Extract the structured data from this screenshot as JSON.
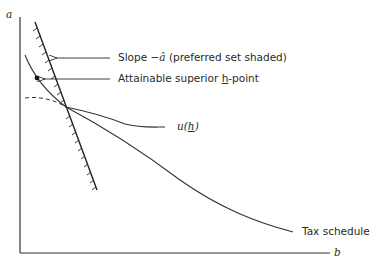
{
  "diagram": {
    "axes": {
      "y_label": "a",
      "x_label": "b"
    },
    "annotations": {
      "slope_prefix": "Slope −",
      "slope_symbol": "â",
      "slope_suffix": " (preferred set shaded)",
      "attainable_prefix": "Attainable superior ",
      "attainable_symbol": "h",
      "attainable_suffix": "-point"
    },
    "curves": {
      "u_label_prefix": "u(",
      "u_label_symbol": "h",
      "u_label_suffix": ")",
      "tax_schedule_label": "Tax schedule"
    },
    "colors": {
      "ink": "#2a2a2a",
      "background": "#ffffff"
    }
  }
}
